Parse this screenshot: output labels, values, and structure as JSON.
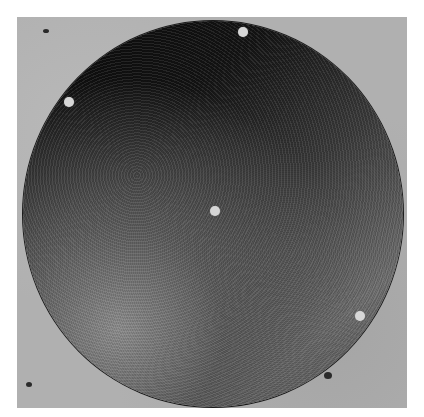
{
  "image": {
    "subject": "circular dark disc with four small holes on grey concrete surface",
    "colors": {
      "background": "#b0b0b0",
      "disc_dark": "#0a0a0a",
      "disc_light": "#8c8c8c",
      "hole": "#d6d6d6"
    },
    "holes": [
      {
        "name": "hole-top",
        "x": 243,
        "y": 32
      },
      {
        "name": "hole-upper-left",
        "x": 69,
        "y": 102
      },
      {
        "name": "hole-center",
        "x": 215,
        "y": 211
      },
      {
        "name": "hole-lower-right",
        "x": 360,
        "y": 316
      }
    ]
  }
}
